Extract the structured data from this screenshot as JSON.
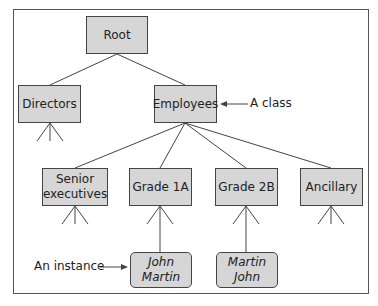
{
  "diagram": {
    "nodes": {
      "root": "Root",
      "directors": "Directors",
      "employees": "Employees",
      "senior_executives": "Senior executives",
      "grade_1a": "Grade 1A",
      "grade_2b": "Grade 2B",
      "ancillary": "Ancillary"
    },
    "instances": {
      "john_martin": "John Martin",
      "martin_john": "Martin John"
    },
    "annotations": {
      "class_label": "A class",
      "instance_label": "An instance"
    },
    "colors": {
      "box_fill": "#d6d6d6",
      "line": "#444444"
    }
  }
}
